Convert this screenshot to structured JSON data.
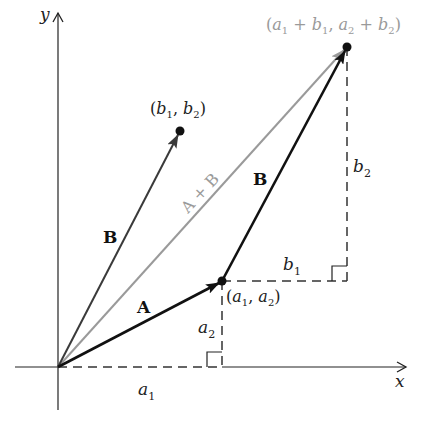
{
  "diagram": {
    "axes": {
      "x_label": "x",
      "y_label": "y"
    },
    "points": {
      "origin": {
        "px": [
          58,
          367
        ]
      },
      "a": {
        "label_main": "(a",
        "label": "(a1, a2)",
        "px": [
          222,
          281
        ]
      },
      "b": {
        "label": "(b1, b2)",
        "px": [
          180,
          131
        ]
      },
      "sum": {
        "label": "(a1 + b1, a2 + b2)",
        "px": [
          347,
          47
        ]
      }
    },
    "vectors": [
      {
        "name": "A",
        "from": "origin",
        "to": "a",
        "color": "#111111"
      },
      {
        "name": "B",
        "from": "origin",
        "to": "b",
        "color": "#333333"
      },
      {
        "name": "B",
        "from": "a",
        "to": "sum",
        "color": "#111111"
      },
      {
        "name": "A + B",
        "from": "origin",
        "to": "sum",
        "color": "#9a9a9a"
      }
    ],
    "labels": {
      "A": "A",
      "B_left": "B",
      "B_right": "B",
      "sum_vector": "A + B",
      "a1": "a",
      "a1_sub": "1",
      "a2": "a",
      "a2_sub": "2",
      "b1": "b",
      "b1_sub": "1",
      "b2": "b",
      "b2_sub": "2",
      "point_a": {
        "open": "(",
        "v1": "a",
        "s1": "1",
        "comma": ", ",
        "v2": "a",
        "s2": "2",
        "close": ")"
      },
      "point_b": {
        "open": "(",
        "v1": "b",
        "s1": "1",
        "comma": ", ",
        "v2": "b",
        "s2": "2",
        "close": ")"
      },
      "point_sum": {
        "open": "(",
        "v1": "a",
        "s1": "1",
        "plus1": " + ",
        "v2": "b",
        "s2": "1",
        "comma": ", ",
        "v3": "a",
        "s3": "2",
        "plus2": " + ",
        "v4": "b",
        "s4": "2",
        "close": ")"
      }
    },
    "colors": {
      "axis": "#222222",
      "vector_dark": "#111111",
      "vector_b_left": "#3a3a3a",
      "vector_sum": "#9a9a9a",
      "dashed": "#333333",
      "sum_label": "#9a9a9a"
    }
  }
}
